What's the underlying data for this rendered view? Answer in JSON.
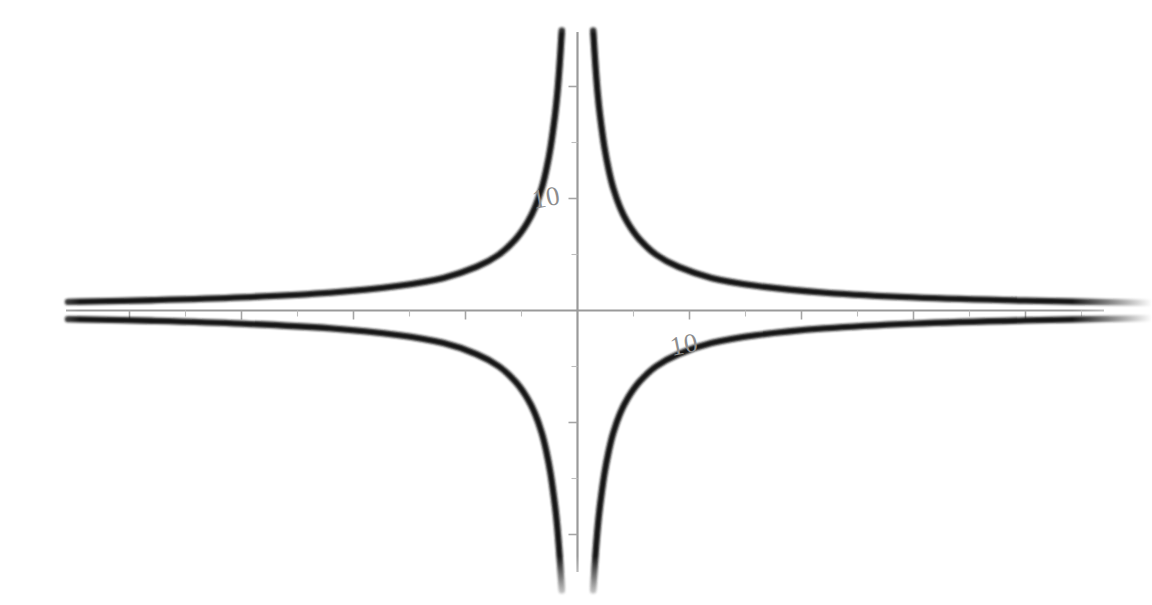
{
  "chart_data": {
    "type": "line",
    "title": "",
    "subtitle": "",
    "xlabel": "",
    "ylabel": "",
    "function": "y = 35/x",
    "k": 35,
    "grid": false,
    "legend": false,
    "legend_position": "none",
    "xlim": [
      -45.5,
      51.3
    ],
    "ylim": [
      -26.4,
      24.3
    ],
    "x_tick_values": [
      -40,
      -35,
      -30,
      -25,
      -20,
      -15,
      -10,
      -5,
      5,
      10,
      15,
      20,
      25,
      30,
      35,
      40,
      45,
      50
    ],
    "y_tick_values": [
      -25,
      -20,
      -15,
      -10,
      -5,
      5,
      10,
      15,
      20
    ],
    "x_tick_labels": [
      "10"
    ],
    "y_tick_labels": [
      "10"
    ],
    "x_labeled_tick_value": 10,
    "y_labeled_tick_value": 10,
    "tick_interval": 5,
    "axis_color": "#9a9a9a",
    "tick_color": "#a5a5a5",
    "curve_color": "#141414",
    "label_color": "#8e8e8e",
    "background_color": "#ffffff",
    "series": [
      {
        "name": "branch-quadrant-I",
        "description": "upper right branch of hyperbola",
        "x": [
          1.4,
          1.6,
          1.8,
          2.0,
          2.4,
          2.8,
          3.2,
          3.8,
          4.5,
          5.5,
          7.0,
          9.0,
          12.0,
          16.0,
          22.0,
          30.0,
          40.0,
          51.3
        ],
        "y": [
          25.0,
          21.9,
          19.4,
          17.5,
          14.6,
          12.5,
          10.9,
          9.2,
          7.8,
          6.4,
          5.0,
          3.9,
          2.9,
          2.2,
          1.6,
          1.17,
          0.88,
          0.68
        ]
      },
      {
        "name": "branch-quadrant-II",
        "description": "upper left branch of hyperbola",
        "x": [
          -45.5,
          -38.0,
          -30.0,
          -22.0,
          -16.0,
          -12.0,
          -9.0,
          -7.0,
          -5.5,
          -4.5,
          -3.8,
          -3.2,
          -2.8,
          -2.4,
          -2.0,
          -1.8,
          -1.6,
          -1.4
        ],
        "y": [
          0.77,
          0.92,
          1.17,
          1.6,
          2.2,
          2.9,
          3.9,
          5.0,
          6.4,
          7.8,
          9.2,
          10.9,
          12.5,
          14.6,
          17.5,
          19.4,
          21.9,
          25.0
        ]
      },
      {
        "name": "branch-quadrant-III",
        "description": "lower left branch of hyperbola",
        "x": [
          -1.4,
          -1.6,
          -1.8,
          -2.0,
          -2.4,
          -2.8,
          -3.2,
          -3.8,
          -4.5,
          -5.5,
          -7.0,
          -9.0,
          -12.0,
          -16.0,
          -22.0,
          -30.0,
          -38.0,
          -45.5
        ],
        "y": [
          -25.0,
          -21.9,
          -19.4,
          -17.5,
          -14.6,
          -12.5,
          -10.9,
          -9.2,
          -7.8,
          -6.4,
          -5.0,
          -3.9,
          -2.9,
          -2.2,
          -1.6,
          -1.17,
          -0.92,
          -0.77
        ]
      },
      {
        "name": "branch-quadrant-IV",
        "description": "lower right branch of hyperbola",
        "x": [
          51.3,
          40.0,
          30.0,
          22.0,
          16.0,
          12.0,
          9.0,
          7.0,
          5.5,
          4.5,
          3.8,
          3.2,
          2.8,
          2.4,
          2.0,
          1.8,
          1.6,
          1.4
        ],
        "y": [
          -0.68,
          -0.88,
          -1.17,
          -1.6,
          -2.2,
          -2.9,
          -3.9,
          -5.0,
          -6.4,
          -7.8,
          -9.2,
          -10.9,
          -12.5,
          -14.6,
          -17.5,
          -19.4,
          -21.9,
          -25.0
        ]
      }
    ]
  },
  "labels": {
    "y_axis_ten": "10",
    "x_axis_ten": "10"
  }
}
